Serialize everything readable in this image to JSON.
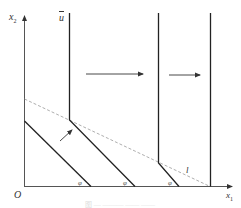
{
  "diagram": {
    "axes": {
      "y_label": "x",
      "y_label_sub": "2",
      "x_label": "x",
      "x_label_sub": "1",
      "origin_label": "O"
    },
    "labels": {
      "u_bar": "u",
      "line_l": "l",
      "angle_1": "φ",
      "angle_2": "φ",
      "angle_3": "φ"
    },
    "caption": "图 — ——— —— ——",
    "colors": {
      "solid_line": "#333333",
      "axis": "#555555",
      "dashed_line": "#999999",
      "arrow": "#333333"
    },
    "elements": [
      {
        "type": "axis",
        "name": "x1-axis"
      },
      {
        "type": "axis",
        "name": "x2-axis"
      },
      {
        "type": "boundary",
        "name": "initial-diagonal"
      },
      {
        "type": "boundary",
        "name": "u-bar-boundary",
        "vertical_then_diagonal": true
      },
      {
        "type": "boundary",
        "name": "second-boundary",
        "vertical_then_diagonal": true
      },
      {
        "type": "boundary",
        "name": "third-vertical"
      },
      {
        "type": "dashed",
        "name": "line-l"
      },
      {
        "type": "arrow",
        "name": "shift-arrow-1",
        "direction": "right"
      },
      {
        "type": "arrow",
        "name": "shift-arrow-2",
        "direction": "right"
      },
      {
        "type": "arrow",
        "name": "diagonal-arrow",
        "direction": "up-right"
      }
    ]
  }
}
